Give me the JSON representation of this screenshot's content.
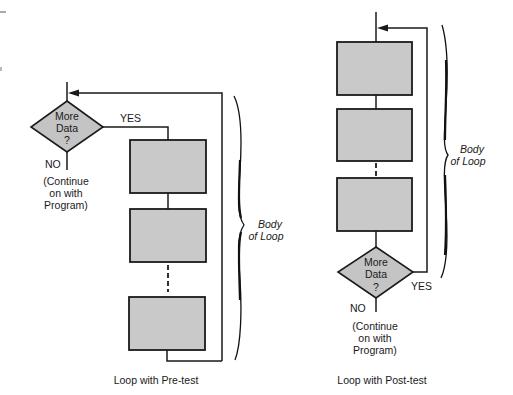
{
  "figure": {
    "left": {
      "caption": "Loop with Pre-test",
      "decision": {
        "line1": "More",
        "line2": "Data",
        "line3": "?"
      },
      "yes_label": "YES",
      "no_label": "NO",
      "continue_text": {
        "line1": "(Continue",
        "line2": "on with",
        "line3": "Program)"
      },
      "brace_label": {
        "line1": "Body",
        "line2": "of Loop"
      },
      "process_boxes": 3
    },
    "right": {
      "caption": "Loop with Post-test",
      "decision": {
        "line1": "More",
        "line2": "Data",
        "line3": "?"
      },
      "yes_label": "YES",
      "no_label": "NO",
      "continue_text": {
        "line1": "(Continue",
        "line2": "on with",
        "line3": "Program)"
      },
      "brace_label": {
        "line1": "Body",
        "line2": "of Loop"
      },
      "process_boxes": 3
    }
  },
  "colors": {
    "box_fill": "#c9c9c9",
    "stroke": "#1a1a1a",
    "background": "#ffffff"
  }
}
